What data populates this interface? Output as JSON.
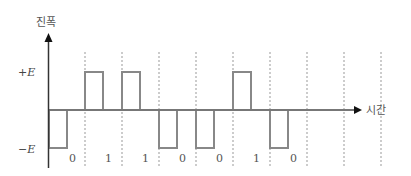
{
  "diagram": {
    "y_axis_label": "진폭",
    "x_axis_label": "시간",
    "levels": {
      "positive": "+E",
      "negative": "−E"
    },
    "bits": [
      "0",
      "1",
      "1",
      "0",
      "0",
      "1",
      "0"
    ],
    "colors": {
      "axis": "#222222",
      "signal": "#888888",
      "grid": "#999999",
      "text": "#444444"
    },
    "encoding_note": "RZ bipolar-like: 1 → +E half-bit pulse, 0 → −E half-bit pulse"
  }
}
